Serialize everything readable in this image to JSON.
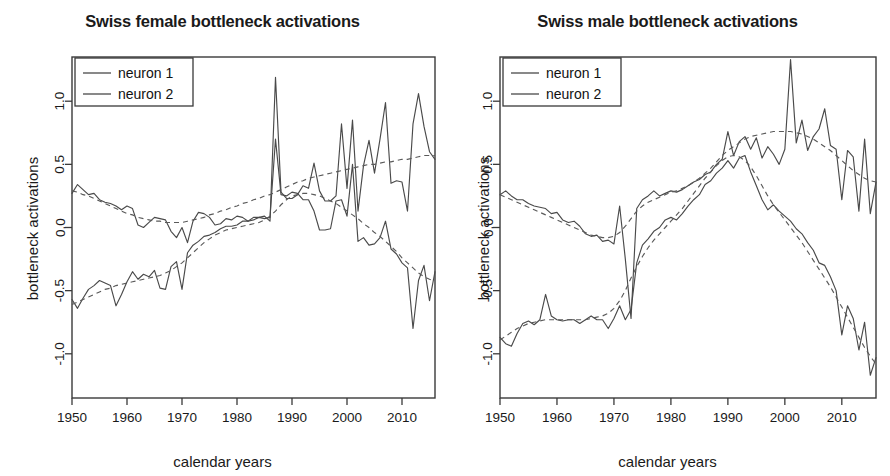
{
  "figure": {
    "xlabel": "calendar years",
    "ylabel": "bottleneck activations"
  },
  "chart_data": [
    {
      "type": "line",
      "title": "Swiss female bottleneck activations",
      "xlabel": "calendar years",
      "ylabel": "bottleneck activations",
      "xlim": [
        1950,
        2016
      ],
      "ylim": [
        -1.35,
        1.35
      ],
      "xticks": [
        1950,
        1960,
        1970,
        1980,
        1990,
        2000,
        2010
      ],
      "yticks": [
        -1.0,
        -0.5,
        0.0,
        0.5,
        1.0
      ],
      "ytick_labels": [
        "-1.0",
        "-0.5",
        "0.0",
        "0.5",
        "1.0"
      ],
      "xtick_labels": [
        "1950",
        "1960",
        "1970",
        "1980",
        "1990",
        "2000",
        "2010"
      ],
      "grid": false,
      "legend_position": "top-left",
      "legend": [
        "neuron 1",
        "neuron 2"
      ],
      "x": [
        1950,
        1951,
        1952,
        1953,
        1954,
        1955,
        1956,
        1957,
        1958,
        1959,
        1960,
        1961,
        1962,
        1963,
        1964,
        1965,
        1966,
        1967,
        1968,
        1969,
        1970,
        1971,
        1972,
        1973,
        1974,
        1975,
        1976,
        1977,
        1978,
        1979,
        1980,
        1981,
        1982,
        1983,
        1984,
        1985,
        1986,
        1987,
        1988,
        1989,
        1990,
        1991,
        1992,
        1993,
        1994,
        1995,
        1996,
        1997,
        1998,
        1999,
        2000,
        2001,
        2002,
        2003,
        2004,
        2005,
        2006,
        2007,
        2008,
        2009,
        2010,
        2011,
        2012,
        2013,
        2014,
        2015,
        2016
      ],
      "series": [
        {
          "name": "neuron 1",
          "values": [
            0.27,
            0.34,
            0.3,
            0.26,
            0.27,
            0.22,
            0.2,
            0.19,
            0.17,
            0.14,
            0.17,
            0.15,
            0.02,
            0.0,
            0.04,
            0.08,
            0.07,
            0.06,
            -0.03,
            -0.08,
            0.0,
            -0.12,
            0.05,
            0.12,
            0.11,
            0.08,
            0.02,
            0.03,
            0.07,
            0.06,
            0.09,
            0.08,
            0.05,
            0.08,
            0.08,
            0.09,
            0.05,
            1.19,
            0.28,
            0.23,
            0.23,
            0.26,
            0.33,
            0.31,
            0.51,
            0.29,
            0.21,
            0.21,
            0.25,
            0.82,
            0.31,
            0.85,
            0.13,
            0.49,
            0.69,
            0.43,
            0.7,
            0.99,
            0.35,
            0.37,
            0.36,
            0.13,
            0.82,
            1.06,
            0.8,
            0.6,
            0.54
          ]
        },
        {
          "name": "neuron 2",
          "values": [
            -0.57,
            -0.64,
            -0.56,
            -0.49,
            -0.46,
            -0.42,
            -0.44,
            -0.46,
            -0.62,
            -0.53,
            -0.43,
            -0.35,
            -0.41,
            -0.37,
            -0.39,
            -0.34,
            -0.48,
            -0.49,
            -0.31,
            -0.27,
            -0.49,
            -0.2,
            -0.14,
            -0.11,
            -0.07,
            -0.06,
            -0.04,
            -0.01,
            0.01,
            0.01,
            0.02,
            0.05,
            0.05,
            0.06,
            0.08,
            0.07,
            0.08,
            0.7,
            0.26,
            0.25,
            0.28,
            0.27,
            0.22,
            0.22,
            0.13,
            -0.02,
            -0.02,
            -0.01,
            0.21,
            0.22,
            0.09,
            0.5,
            -0.11,
            -0.08,
            -0.14,
            -0.13,
            -0.08,
            0.05,
            -0.17,
            -0.21,
            -0.28,
            -0.32,
            -0.8,
            -0.42,
            -0.3,
            -0.58,
            -0.35
          ]
        }
      ],
      "trends": [
        {
          "name": "neuron 1 smooth",
          "values": [
            0.29,
            0.28,
            0.26,
            0.25,
            0.23,
            0.21,
            0.19,
            0.17,
            0.15,
            0.13,
            0.11,
            0.1,
            0.08,
            0.07,
            0.06,
            0.05,
            0.05,
            0.04,
            0.04,
            0.04,
            0.04,
            0.05,
            0.06,
            0.07,
            0.08,
            0.1,
            0.11,
            0.13,
            0.14,
            0.16,
            0.17,
            0.19,
            0.2,
            0.22,
            0.23,
            0.25,
            0.26,
            0.28,
            0.3,
            0.32,
            0.34,
            0.36,
            0.37,
            0.39,
            0.4,
            0.41,
            0.42,
            0.43,
            0.44,
            0.45,
            0.46,
            0.47,
            0.48,
            0.49,
            0.5,
            0.5,
            0.51,
            0.52,
            0.52,
            0.53,
            0.54,
            0.54,
            0.55,
            0.56,
            0.57,
            0.57,
            0.57
          ]
        },
        {
          "name": "neuron 2 smooth",
          "values": [
            -0.61,
            -0.59,
            -0.57,
            -0.55,
            -0.53,
            -0.51,
            -0.49,
            -0.48,
            -0.46,
            -0.45,
            -0.44,
            -0.43,
            -0.42,
            -0.41,
            -0.4,
            -0.39,
            -0.38,
            -0.36,
            -0.34,
            -0.31,
            -0.28,
            -0.24,
            -0.2,
            -0.16,
            -0.12,
            -0.09,
            -0.06,
            -0.04,
            -0.02,
            -0.01,
            0.0,
            0.01,
            0.02,
            0.03,
            0.04,
            0.06,
            0.09,
            0.13,
            0.18,
            0.22,
            0.25,
            0.26,
            0.27,
            0.27,
            0.26,
            0.25,
            0.23,
            0.21,
            0.19,
            0.16,
            0.13,
            0.1,
            0.07,
            0.03,
            0.0,
            -0.04,
            -0.07,
            -0.11,
            -0.15,
            -0.19,
            -0.24,
            -0.28,
            -0.32,
            -0.36,
            -0.39,
            -0.41,
            -0.42
          ]
        }
      ]
    },
    {
      "type": "line",
      "title": "Swiss male bottleneck activations",
      "xlabel": "calendar years",
      "ylabel": "bottleneck activations",
      "xlim": [
        1950,
        2016
      ],
      "ylim": [
        -1.35,
        1.35
      ],
      "xticks": [
        1950,
        1960,
        1970,
        1980,
        1990,
        2000,
        2010
      ],
      "yticks": [
        -1.0,
        -0.5,
        0.0,
        0.5,
        1.0
      ],
      "ytick_labels": [
        "-1.0",
        "-0.5",
        "0.0",
        "0.5",
        "1.0"
      ],
      "xtick_labels": [
        "1950",
        "1960",
        "1970",
        "1980",
        "1990",
        "2000",
        "2010"
      ],
      "grid": false,
      "legend_position": "top-left",
      "legend": [
        "neuron 1",
        "neuron 2"
      ],
      "x": [
        1950,
        1951,
        1952,
        1953,
        1954,
        1955,
        1956,
        1957,
        1958,
        1959,
        1960,
        1961,
        1962,
        1963,
        1964,
        1965,
        1966,
        1967,
        1968,
        1969,
        1970,
        1971,
        1972,
        1973,
        1974,
        1975,
        1976,
        1977,
        1978,
        1979,
        1980,
        1981,
        1982,
        1983,
        1984,
        1985,
        1986,
        1987,
        1988,
        1989,
        1990,
        1991,
        1992,
        1993,
        1994,
        1995,
        1996,
        1997,
        1998,
        1999,
        2000,
        2001,
        2002,
        2003,
        2004,
        2005,
        2006,
        2007,
        2008,
        2009,
        2010,
        2011,
        2012,
        2013,
        2014,
        2015,
        2016
      ],
      "series": [
        {
          "name": "neuron 1",
          "values": [
            0.26,
            0.29,
            0.25,
            0.22,
            0.22,
            0.19,
            0.17,
            0.16,
            0.15,
            0.11,
            0.12,
            0.06,
            0.04,
            0.05,
            0.01,
            -0.05,
            -0.07,
            -0.06,
            -0.11,
            -0.1,
            -0.13,
            0.17,
            -0.25,
            -0.72,
            0.15,
            0.22,
            0.25,
            0.29,
            0.25,
            0.27,
            0.29,
            0.28,
            0.3,
            0.33,
            0.36,
            0.38,
            0.42,
            0.44,
            0.5,
            0.54,
            0.76,
            0.57,
            0.68,
            0.72,
            0.62,
            0.71,
            0.55,
            0.64,
            0.58,
            0.5,
            0.62,
            1.33,
            0.67,
            0.85,
            0.61,
            0.72,
            0.78,
            0.94,
            0.65,
            0.62,
            0.22,
            0.61,
            0.56,
            0.13,
            0.7,
            0.11,
            0.36
          ]
        },
        {
          "name": "neuron 2",
          "values": [
            -0.87,
            -0.92,
            -0.94,
            -0.84,
            -0.76,
            -0.74,
            -0.77,
            -0.73,
            -0.53,
            -0.7,
            -0.73,
            -0.74,
            -0.73,
            -0.73,
            -0.76,
            -0.73,
            -0.7,
            -0.73,
            -0.73,
            -0.8,
            -0.72,
            -0.62,
            -0.73,
            -0.65,
            -0.28,
            -0.14,
            -0.09,
            -0.03,
            0.0,
            0.06,
            0.08,
            0.06,
            0.11,
            0.17,
            0.22,
            0.26,
            0.34,
            0.37,
            0.43,
            0.47,
            0.53,
            0.47,
            0.55,
            0.57,
            0.44,
            0.33,
            0.22,
            0.14,
            0.18,
            0.13,
            0.09,
            0.05,
            -0.01,
            -0.05,
            -0.12,
            -0.18,
            -0.28,
            -0.3,
            -0.39,
            -0.5,
            -0.85,
            -0.62,
            -0.72,
            -0.97,
            -0.75,
            -1.17,
            -1.03
          ]
        }
      ],
      "trends": [
        {
          "name": "neuron 1 smooth",
          "values": [
            0.26,
            0.24,
            0.22,
            0.2,
            0.18,
            0.16,
            0.14,
            0.12,
            0.1,
            0.08,
            0.06,
            0.04,
            0.02,
            0.0,
            -0.02,
            -0.04,
            -0.06,
            -0.07,
            -0.08,
            -0.08,
            -0.07,
            -0.04,
            0.01,
            0.07,
            0.13,
            0.17,
            0.2,
            0.22,
            0.24,
            0.26,
            0.28,
            0.29,
            0.31,
            0.33,
            0.36,
            0.39,
            0.43,
            0.47,
            0.52,
            0.57,
            0.61,
            0.64,
            0.67,
            0.7,
            0.72,
            0.73,
            0.74,
            0.75,
            0.76,
            0.76,
            0.76,
            0.76,
            0.75,
            0.74,
            0.72,
            0.7,
            0.67,
            0.64,
            0.61,
            0.57,
            0.53,
            0.49,
            0.45,
            0.42,
            0.39,
            0.37,
            0.36
          ]
        },
        {
          "name": "neuron 2 smooth",
          "values": [
            -0.89,
            -0.86,
            -0.83,
            -0.8,
            -0.78,
            -0.76,
            -0.75,
            -0.74,
            -0.73,
            -0.73,
            -0.73,
            -0.73,
            -0.73,
            -0.73,
            -0.73,
            -0.73,
            -0.72,
            -0.71,
            -0.7,
            -0.68,
            -0.64,
            -0.58,
            -0.5,
            -0.4,
            -0.31,
            -0.23,
            -0.16,
            -0.1,
            -0.05,
            0.0,
            0.05,
            0.1,
            0.15,
            0.21,
            0.27,
            0.33,
            0.39,
            0.44,
            0.49,
            0.53,
            0.56,
            0.57,
            0.56,
            0.53,
            0.48,
            0.41,
            0.33,
            0.25,
            0.18,
            0.12,
            0.06,
            0.0,
            -0.06,
            -0.12,
            -0.19,
            -0.26,
            -0.33,
            -0.4,
            -0.47,
            -0.55,
            -0.63,
            -0.71,
            -0.79,
            -0.87,
            -0.95,
            -1.02,
            -1.08
          ]
        }
      ]
    }
  ]
}
